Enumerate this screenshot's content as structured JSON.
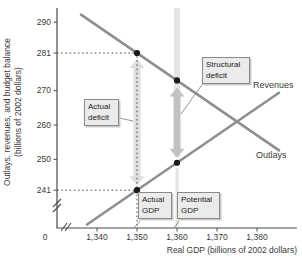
{
  "chart_data": {
    "type": "line",
    "title": "",
    "xlabel": "Real GDP (billions of 2002 dollars)",
    "ylabel": "Outlays, revenues, and budget balance (billions of 2002 dollars)",
    "ylabel_lines": [
      "Outlays, revenues, and budget balance",
      "(billions of 2002 dollars)"
    ],
    "grid": false,
    "x_ticks": [
      {
        "value": 0,
        "label": "0"
      },
      {
        "value": 1340,
        "label": "1,340"
      },
      {
        "value": 1350,
        "label": "1,350"
      },
      {
        "value": 1360,
        "label": "1,360"
      },
      {
        "value": 1370,
        "label": "1,370"
      },
      {
        "value": 1380,
        "label": "1,380"
      }
    ],
    "y_ticks": [
      {
        "value": 290,
        "label": "290"
      },
      {
        "value": 281,
        "label": "281"
      },
      {
        "value": 270,
        "label": "270"
      },
      {
        "value": 260,
        "label": "260"
      },
      {
        "value": 250,
        "label": "250"
      },
      {
        "value": 241,
        "label": "241"
      }
    ],
    "axis_breaks": {
      "x_axis": true,
      "y_axis": true
    },
    "series": [
      {
        "name": "Revenues",
        "points_gdp_value": [
          [
            1337.5,
            231.0
          ],
          [
            1385.5,
            269.4
          ]
        ]
      },
      {
        "name": "Outlays",
        "points_gdp_value": [
          [
            1336.0,
            292.2
          ],
          [
            1385.5,
            252.6
          ]
        ]
      }
    ],
    "marked_points": [
      {
        "gdp": 1350,
        "value": 281,
        "series": "Outlays"
      },
      {
        "gdp": 1360,
        "value": 273,
        "series": "Outlays"
      },
      {
        "gdp": 1360,
        "value": 249,
        "series": "Revenues"
      },
      {
        "gdp": 1350,
        "value": 241,
        "series": "Revenues"
      }
    ],
    "annotations": {
      "actual_deficit": {
        "label": "Actual deficit",
        "gdp": 1350,
        "from_value": 241,
        "to_value": 281
      },
      "structural_deficit": {
        "label": "Structural deficit",
        "gdp": 1360,
        "from_value": 249,
        "to_value": 273
      },
      "actual_gdp": {
        "label": "Actual GDP",
        "gdp": 1350
      },
      "potential_gdp": {
        "label": "Potential GDP",
        "gdp": 1360
      }
    },
    "colors": {
      "series_line": "#8f8f8f",
      "marked_point": "#1a1a1a",
      "potential_gdp_band": "#e4e4e4",
      "actual_deficit_arrow": "#dfdfdf",
      "structural_deficit_arrow": "#c2c2c2",
      "label_box_fill": "#ebebeb",
      "label_box_border": "#8a8a8a",
      "axis": "#4a4a4a",
      "dotted_guide": "#3a3a3a",
      "text": "#2f2f2f"
    }
  }
}
